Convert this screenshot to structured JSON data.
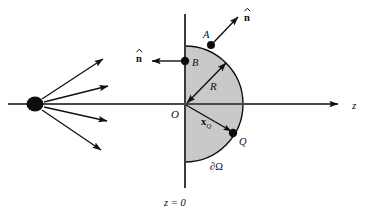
{
  "figure": {
    "background_color": "#ffffff",
    "stroke_color": "#101010",
    "region_fill_color": "#c9c9c9",
    "width": 369,
    "height": 216
  },
  "labels": {
    "z_axis": "z",
    "plane": "z = 0",
    "origin": "O",
    "radius": "R",
    "point_a": "A",
    "point_b": "B",
    "point_q": "Q",
    "normal_a": "n",
    "normal_b": "n",
    "position_vector_base": "x",
    "position_vector_sub": "Q",
    "boundary": "∂Ω"
  },
  "geometry": {
    "origin": {
      "x": 185,
      "y": 104
    },
    "radius": 58,
    "z_axis": {
      "x1": 8,
      "y1": 104,
      "x2": 345,
      "y2": 104
    },
    "vertical_axis": {
      "x1": 185,
      "y1": 14,
      "x2": 185,
      "y2": 188
    },
    "source_point": {
      "x": 35,
      "y": 104,
      "rx": 8,
      "ry": 7
    },
    "point_a": {
      "x": 211,
      "y": 45,
      "r": 4
    },
    "point_b": {
      "x": 185,
      "y": 61,
      "r": 4
    },
    "point_q": {
      "x": 233,
      "y": 133,
      "r": 4
    },
    "normal_a_arrow": {
      "x1": 215,
      "y1": 42,
      "x2": 238,
      "y2": 16
    },
    "normal_b_arrow": {
      "x1": 181,
      "y1": 61,
      "x2": 151,
      "y2": 61
    },
    "radius_arrow": {
      "x1": 186,
      "y1": 104,
      "x2": 227,
      "y2": 62
    },
    "xq_arrow": {
      "x1": 186,
      "y1": 105,
      "x2": 231,
      "y2": 131
    },
    "rays": [
      {
        "x1": 42,
        "y1": 99,
        "x2": 106,
        "y2": 58
      },
      {
        "x1": 44,
        "y1": 102,
        "x2": 110,
        "y2": 85
      },
      {
        "x1": 44,
        "y1": 107,
        "x2": 110,
        "y2": 122
      },
      {
        "x1": 42,
        "y1": 110,
        "x2": 104,
        "y2": 152
      }
    ]
  },
  "label_positions": {
    "z_axis": {
      "x": 352,
      "y": 108
    },
    "plane": {
      "x": 168,
      "y": 204
    },
    "origin": {
      "x": 173,
      "y": 117
    },
    "radius": {
      "x": 212,
      "y": 87
    },
    "point_a": {
      "x": 205,
      "y": 36
    },
    "point_b": {
      "x": 192,
      "y": 66
    },
    "point_q": {
      "x": 240,
      "y": 144
    },
    "normal_a": {
      "x": 245,
      "y": 19
    },
    "normal_b": {
      "x": 137,
      "y": 60
    },
    "position_vector": {
      "x": 203,
      "y": 123
    },
    "boundary": {
      "x": 213,
      "y": 167
    }
  }
}
